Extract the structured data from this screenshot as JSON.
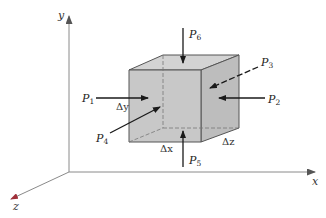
{
  "figure": {
    "colors": {
      "background": "#ffffff",
      "cube_face": "#c8c8c8",
      "cube_face_side": "#bdbdbd",
      "cube_face_top": "#d3d3d3",
      "edge": "#555555",
      "arrow": "#1a1a1a",
      "axis": "#8a8a8a",
      "z_axis_tip": "#a0303a"
    }
  },
  "axes": {
    "x": {
      "label": "x"
    },
    "y": {
      "label": "y"
    },
    "z": {
      "label": "z"
    }
  },
  "forces": [
    {
      "id": "P1",
      "symbol": "P",
      "subscript": "1",
      "direction": "+x (into left face)"
    },
    {
      "id": "P2",
      "symbol": "P",
      "subscript": "2",
      "direction": "-x (into right face)"
    },
    {
      "id": "P3",
      "symbol": "P",
      "subscript": "3",
      "direction": "into back face (dashed)"
    },
    {
      "id": "P4",
      "symbol": "P",
      "subscript": "4",
      "direction": "into front face"
    },
    {
      "id": "P5",
      "symbol": "P",
      "subscript": "5",
      "direction": "+y (into bottom face)"
    },
    {
      "id": "P6",
      "symbol": "P",
      "subscript": "6",
      "direction": "-y (into top face)"
    }
  ],
  "dimensions": {
    "dx": "Δx",
    "dy": "Δy",
    "dz": "Δz"
  }
}
